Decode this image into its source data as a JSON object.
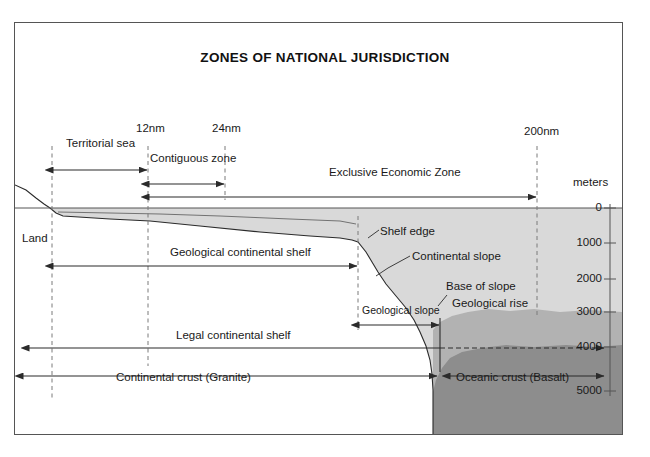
{
  "figure": {
    "title": "ZONES OF NATIONAL JURISDICTION",
    "type": "cross-section-diagram"
  },
  "distance_markers": [
    {
      "id": "baseline",
      "label": "",
      "x": 52
    },
    {
      "id": "m12",
      "label": "12nm",
      "x": 148
    },
    {
      "id": "m24",
      "label": "24nm",
      "x": 225
    },
    {
      "id": "shelf",
      "label": "",
      "x": 358
    },
    {
      "id": "m200",
      "label": "200nm",
      "x": 537
    }
  ],
  "zones": [
    {
      "name": "Territorial sea",
      "from_x": 52,
      "to_x": 148,
      "y": 170
    },
    {
      "name": "Contiguous zone",
      "from_x": 148,
      "to_x": 225,
      "y": 184
    },
    {
      "name": "Exclusive Economic Zone",
      "from_x": 148,
      "to_x": 537,
      "y": 196
    },
    {
      "name": "Geological continental shelf",
      "from_x": 52,
      "to_x": 358,
      "y": 266
    },
    {
      "name": "Geological slope",
      "from_x": 358,
      "to_x": 440,
      "y": 325
    },
    {
      "name": "Legal continental shelf",
      "from_x": 28,
      "to_x": 440,
      "y": 348
    },
    {
      "name": "Continental crust (Granite)",
      "from_x": 22,
      "to_x": 437,
      "y": 376
    },
    {
      "name": "Oceanic crust (Basalt)",
      "from_x": 450,
      "to_x": 600,
      "y": 376
    }
  ],
  "feature_labels": [
    {
      "name": "Land",
      "x": 24,
      "y": 232
    },
    {
      "name": "Shelf edge",
      "x": 381,
      "y": 228
    },
    {
      "name": "Continental slope",
      "x": 413,
      "y": 253
    },
    {
      "name": "Base of slope",
      "x": 447,
      "y": 283
    },
    {
      "name": "Geological rise",
      "x": 451,
      "y": 300
    },
    {
      "name": "Geological continental shelf",
      "x": 172,
      "y": 250
    },
    {
      "name": "Legal continental shelf",
      "x": 178,
      "y": 333
    },
    {
      "name": "Geological slope",
      "x": 363,
      "y": 308
    },
    {
      "name": "Continental crust (Granite)",
      "x": 118,
      "y": 372
    },
    {
      "name": "Oceanic crust (Basalt)",
      "x": 457,
      "y": 376
    }
  ],
  "depth_axis": {
    "unit_label": "meters",
    "unit_label_x": 573,
    "unit_label_y": 182,
    "axis_x": 610,
    "ticks": [
      {
        "value": "0",
        "y": 208
      },
      {
        "value": "1000",
        "y": 243
      },
      {
        "value": "2000",
        "y": 279
      },
      {
        "value": "3000",
        "y": 312
      },
      {
        "value": "4000",
        "y": 347
      },
      {
        "value": "5000",
        "y": 391
      }
    ]
  },
  "colors": {
    "water": "#d9d9d9",
    "sediment": "#b2b2b2",
    "crust_dark": "#8d8d8d",
    "land_white": "#ffffff",
    "line": "#2b2b2b",
    "frame": "#555555",
    "dashed": "#777777",
    "text": "#1a1a1a"
  },
  "sea_level_y": 208
}
